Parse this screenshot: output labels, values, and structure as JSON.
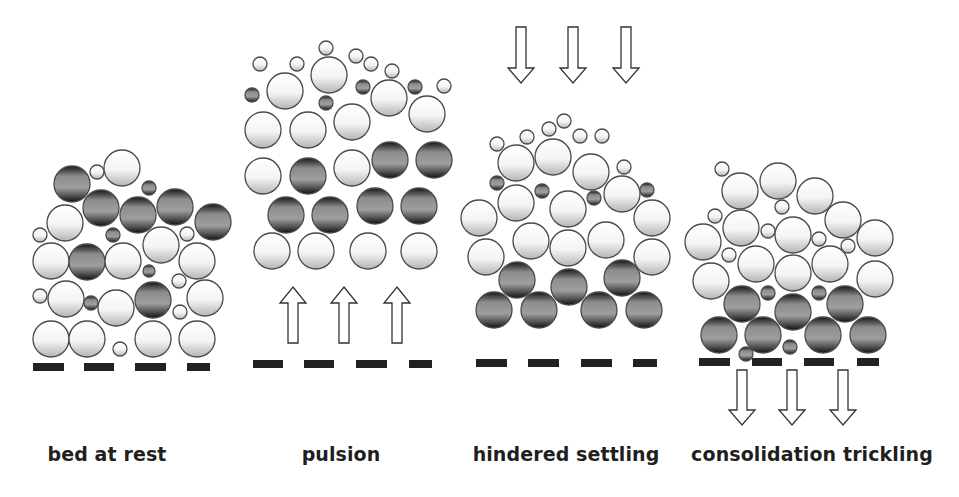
{
  "figure": {
    "colors": {
      "light_particle_top": "#ffffff",
      "light_particle_bottom": "#b8b8b8",
      "dense_particle_edge": "#1a1a1a",
      "dense_particle_mid": "#9a9a9a",
      "outline": "#4a4a4a",
      "base_bar": "#222222",
      "arrow_fill": "#ffffff",
      "arrow_stroke": "#333333"
    },
    "panels": [
      {
        "id": "bed-at-rest",
        "label": "bed at rest",
        "label_x": 107,
        "bars": [
          [
            33,
            64
          ],
          [
            84,
            114
          ],
          [
            135,
            166
          ],
          [
            187,
            210
          ]
        ],
        "bar_y": 363,
        "arrows": [],
        "particles": [
          {
            "x": 72,
            "y": 184,
            "r": 18,
            "t": "dense"
          },
          {
            "x": 97,
            "y": 172,
            "r": 7,
            "t": "light"
          },
          {
            "x": 122,
            "y": 168,
            "r": 18,
            "t": "light"
          },
          {
            "x": 149,
            "y": 188,
            "r": 7,
            "t": "dense"
          },
          {
            "x": 101,
            "y": 208,
            "r": 18,
            "t": "dense"
          },
          {
            "x": 138,
            "y": 215,
            "r": 18,
            "t": "dense"
          },
          {
            "x": 175,
            "y": 207,
            "r": 18,
            "t": "dense"
          },
          {
            "x": 213,
            "y": 222,
            "r": 18,
            "t": "dense"
          },
          {
            "x": 65,
            "y": 223,
            "r": 18,
            "t": "light"
          },
          {
            "x": 40,
            "y": 235,
            "r": 7,
            "t": "light"
          },
          {
            "x": 113,
            "y": 235,
            "r": 7,
            "t": "dense"
          },
          {
            "x": 161,
            "y": 245,
            "r": 18,
            "t": "light"
          },
          {
            "x": 187,
            "y": 234,
            "r": 7,
            "t": "light"
          },
          {
            "x": 51,
            "y": 261,
            "r": 18,
            "t": "light"
          },
          {
            "x": 87,
            "y": 262,
            "r": 18,
            "t": "dense"
          },
          {
            "x": 123,
            "y": 261,
            "r": 18,
            "t": "light"
          },
          {
            "x": 149,
            "y": 271,
            "r": 6,
            "t": "dense"
          },
          {
            "x": 197,
            "y": 261,
            "r": 18,
            "t": "light"
          },
          {
            "x": 179,
            "y": 281,
            "r": 7,
            "t": "light"
          },
          {
            "x": 40,
            "y": 296,
            "r": 7,
            "t": "light"
          },
          {
            "x": 66,
            "y": 299,
            "r": 18,
            "t": "light"
          },
          {
            "x": 91,
            "y": 303,
            "r": 7,
            "t": "dense"
          },
          {
            "x": 116,
            "y": 308,
            "r": 18,
            "t": "light"
          },
          {
            "x": 153,
            "y": 300,
            "r": 18,
            "t": "dense"
          },
          {
            "x": 180,
            "y": 312,
            "r": 7,
            "t": "light"
          },
          {
            "x": 205,
            "y": 298,
            "r": 18,
            "t": "light"
          },
          {
            "x": 51,
            "y": 339,
            "r": 18,
            "t": "light"
          },
          {
            "x": 87,
            "y": 339,
            "r": 18,
            "t": "light"
          },
          {
            "x": 120,
            "y": 349,
            "r": 7,
            "t": "light"
          },
          {
            "x": 153,
            "y": 339,
            "r": 18,
            "t": "light"
          },
          {
            "x": 197,
            "y": 339,
            "r": 18,
            "t": "light"
          }
        ]
      },
      {
        "id": "pulsion",
        "label": "pulsion",
        "label_x": 341,
        "bars": [
          [
            253,
            283
          ],
          [
            304,
            334
          ],
          [
            356,
            387
          ],
          [
            409,
            432
          ]
        ],
        "bar_y": 360,
        "arrows": [
          {
            "dir": "up",
            "x": 293,
            "tip": 287,
            "head_base": 303,
            "tail": 343
          },
          {
            "dir": "up",
            "x": 344,
            "tip": 287,
            "head_base": 303,
            "tail": 343
          },
          {
            "dir": "up",
            "x": 397,
            "tip": 287,
            "head_base": 303,
            "tail": 343
          }
        ],
        "particles": [
          {
            "x": 260,
            "y": 64,
            "r": 7,
            "t": "light"
          },
          {
            "x": 297,
            "y": 64,
            "r": 7,
            "t": "light"
          },
          {
            "x": 326,
            "y": 48,
            "r": 7,
            "t": "light"
          },
          {
            "x": 356,
            "y": 56,
            "r": 7,
            "t": "light"
          },
          {
            "x": 371,
            "y": 64,
            "r": 7,
            "t": "light"
          },
          {
            "x": 392,
            "y": 71,
            "r": 7,
            "t": "light"
          },
          {
            "x": 444,
            "y": 86,
            "r": 7,
            "t": "light"
          },
          {
            "x": 252,
            "y": 95,
            "r": 7,
            "t": "dense"
          },
          {
            "x": 285,
            "y": 91,
            "r": 18,
            "t": "light"
          },
          {
            "x": 329,
            "y": 75,
            "r": 18,
            "t": "light"
          },
          {
            "x": 326,
            "y": 103,
            "r": 7,
            "t": "dense"
          },
          {
            "x": 363,
            "y": 87,
            "r": 7,
            "t": "dense"
          },
          {
            "x": 389,
            "y": 98,
            "r": 18,
            "t": "light"
          },
          {
            "x": 415,
            "y": 87,
            "r": 7,
            "t": "dense"
          },
          {
            "x": 427,
            "y": 114,
            "r": 18,
            "t": "light"
          },
          {
            "x": 263,
            "y": 130,
            "r": 18,
            "t": "light"
          },
          {
            "x": 308,
            "y": 130,
            "r": 18,
            "t": "light"
          },
          {
            "x": 352,
            "y": 122,
            "r": 18,
            "t": "light"
          },
          {
            "x": 263,
            "y": 176,
            "r": 18,
            "t": "light"
          },
          {
            "x": 308,
            "y": 176,
            "r": 18,
            "t": "dense"
          },
          {
            "x": 352,
            "y": 168,
            "r": 18,
            "t": "light"
          },
          {
            "x": 390,
            "y": 160,
            "r": 18,
            "t": "dense"
          },
          {
            "x": 434,
            "y": 160,
            "r": 18,
            "t": "dense"
          },
          {
            "x": 286,
            "y": 215,
            "r": 18,
            "t": "dense"
          },
          {
            "x": 330,
            "y": 215,
            "r": 18,
            "t": "dense"
          },
          {
            "x": 375,
            "y": 206,
            "r": 18,
            "t": "dense"
          },
          {
            "x": 419,
            "y": 206,
            "r": 18,
            "t": "dense"
          },
          {
            "x": 272,
            "y": 251,
            "r": 18,
            "t": "light"
          },
          {
            "x": 316,
            "y": 251,
            "r": 18,
            "t": "light"
          },
          {
            "x": 368,
            "y": 251,
            "r": 18,
            "t": "light"
          },
          {
            "x": 419,
            "y": 251,
            "r": 18,
            "t": "light"
          }
        ]
      },
      {
        "id": "hindered-settling",
        "label": "hindered settling",
        "label_x": 566,
        "bars": [
          [
            476,
            507
          ],
          [
            528,
            559
          ],
          [
            581,
            612
          ],
          [
            633,
            657
          ]
        ],
        "bar_y": 359,
        "arrows": [
          {
            "dir": "down",
            "x": 521,
            "tip": 83,
            "head_base": 68,
            "tail": 27
          },
          {
            "dir": "down",
            "x": 573,
            "tip": 83,
            "head_base": 68,
            "tail": 27
          },
          {
            "dir": "down",
            "x": 626,
            "tip": 83,
            "head_base": 68,
            "tail": 27
          }
        ],
        "particles": [
          {
            "x": 497,
            "y": 144,
            "r": 7,
            "t": "light"
          },
          {
            "x": 527,
            "y": 137,
            "r": 7,
            "t": "light"
          },
          {
            "x": 549,
            "y": 129,
            "r": 7,
            "t": "light"
          },
          {
            "x": 564,
            "y": 121,
            "r": 7,
            "t": "light"
          },
          {
            "x": 580,
            "y": 136,
            "r": 7,
            "t": "light"
          },
          {
            "x": 602,
            "y": 136,
            "r": 7,
            "t": "light"
          },
          {
            "x": 624,
            "y": 167,
            "r": 7,
            "t": "light"
          },
          {
            "x": 516,
            "y": 163,
            "r": 18,
            "t": "light"
          },
          {
            "x": 553,
            "y": 157,
            "r": 18,
            "t": "light"
          },
          {
            "x": 591,
            "y": 172,
            "r": 18,
            "t": "light"
          },
          {
            "x": 497,
            "y": 183,
            "r": 7,
            "t": "dense"
          },
          {
            "x": 542,
            "y": 191,
            "r": 7,
            "t": "dense"
          },
          {
            "x": 594,
            "y": 198,
            "r": 7,
            "t": "dense"
          },
          {
            "x": 647,
            "y": 190,
            "r": 7,
            "t": "dense"
          },
          {
            "x": 516,
            "y": 203,
            "r": 18,
            "t": "light"
          },
          {
            "x": 568,
            "y": 209,
            "r": 18,
            "t": "light"
          },
          {
            "x": 622,
            "y": 194,
            "r": 18,
            "t": "light"
          },
          {
            "x": 479,
            "y": 218,
            "r": 18,
            "t": "light"
          },
          {
            "x": 652,
            "y": 218,
            "r": 18,
            "t": "light"
          },
          {
            "x": 531,
            "y": 241,
            "r": 18,
            "t": "light"
          },
          {
            "x": 568,
            "y": 248,
            "r": 18,
            "t": "light"
          },
          {
            "x": 606,
            "y": 240,
            "r": 18,
            "t": "light"
          },
          {
            "x": 486,
            "y": 257,
            "r": 18,
            "t": "light"
          },
          {
            "x": 652,
            "y": 257,
            "r": 18,
            "t": "light"
          },
          {
            "x": 517,
            "y": 280,
            "r": 18,
            "t": "dense"
          },
          {
            "x": 569,
            "y": 287,
            "r": 18,
            "t": "dense"
          },
          {
            "x": 622,
            "y": 278,
            "r": 18,
            "t": "dense"
          },
          {
            "x": 494,
            "y": 310,
            "r": 18,
            "t": "dense"
          },
          {
            "x": 539,
            "y": 310,
            "r": 18,
            "t": "dense"
          },
          {
            "x": 599,
            "y": 310,
            "r": 18,
            "t": "dense"
          },
          {
            "x": 644,
            "y": 310,
            "r": 18,
            "t": "dense"
          }
        ]
      },
      {
        "id": "consolidation-trickling",
        "label": "consolidation trickling",
        "label_x": 812,
        "bars": [
          [
            699,
            730
          ],
          [
            752,
            782
          ],
          [
            804,
            834
          ],
          [
            857,
            879
          ]
        ],
        "bar_y": 358,
        "arrows": [
          {
            "dir": "down",
            "x": 742,
            "tip": 425,
            "head_base": 410,
            "tail": 370
          },
          {
            "dir": "down",
            "x": 792,
            "tip": 425,
            "head_base": 410,
            "tail": 370
          },
          {
            "dir": "down",
            "x": 843,
            "tip": 425,
            "head_base": 410,
            "tail": 370
          }
        ],
        "particles": [
          {
            "x": 722,
            "y": 169,
            "r": 7,
            "t": "light"
          },
          {
            "x": 740,
            "y": 191,
            "r": 18,
            "t": "light"
          },
          {
            "x": 778,
            "y": 181,
            "r": 18,
            "t": "light"
          },
          {
            "x": 815,
            "y": 196,
            "r": 18,
            "t": "light"
          },
          {
            "x": 782,
            "y": 207,
            "r": 7,
            "t": "light"
          },
          {
            "x": 843,
            "y": 220,
            "r": 18,
            "t": "light"
          },
          {
            "x": 715,
            "y": 216,
            "r": 7,
            "t": "light"
          },
          {
            "x": 741,
            "y": 228,
            "r": 18,
            "t": "light"
          },
          {
            "x": 768,
            "y": 231,
            "r": 7,
            "t": "light"
          },
          {
            "x": 793,
            "y": 235,
            "r": 18,
            "t": "light"
          },
          {
            "x": 819,
            "y": 239,
            "r": 7,
            "t": "light"
          },
          {
            "x": 703,
            "y": 242,
            "r": 18,
            "t": "light"
          },
          {
            "x": 875,
            "y": 238,
            "r": 18,
            "t": "light"
          },
          {
            "x": 848,
            "y": 246,
            "r": 7,
            "t": "light"
          },
          {
            "x": 729,
            "y": 255,
            "r": 7,
            "t": "light"
          },
          {
            "x": 756,
            "y": 264,
            "r": 18,
            "t": "light"
          },
          {
            "x": 793,
            "y": 273,
            "r": 18,
            "t": "light"
          },
          {
            "x": 830,
            "y": 264,
            "r": 18,
            "t": "light"
          },
          {
            "x": 711,
            "y": 281,
            "r": 18,
            "t": "light"
          },
          {
            "x": 875,
            "y": 279,
            "r": 18,
            "t": "light"
          },
          {
            "x": 768,
            "y": 293,
            "r": 7,
            "t": "dense"
          },
          {
            "x": 819,
            "y": 293,
            "r": 7,
            "t": "dense"
          },
          {
            "x": 742,
            "y": 304,
            "r": 18,
            "t": "dense"
          },
          {
            "x": 793,
            "y": 312,
            "r": 18,
            "t": "dense"
          },
          {
            "x": 845,
            "y": 304,
            "r": 18,
            "t": "dense"
          },
          {
            "x": 719,
            "y": 335,
            "r": 18,
            "t": "dense"
          },
          {
            "x": 763,
            "y": 335,
            "r": 18,
            "t": "dense"
          },
          {
            "x": 823,
            "y": 335,
            "r": 18,
            "t": "dense"
          },
          {
            "x": 868,
            "y": 335,
            "r": 18,
            "t": "dense"
          },
          {
            "x": 790,
            "y": 347,
            "r": 7,
            "t": "dense"
          },
          {
            "x": 746,
            "y": 354,
            "r": 7,
            "t": "dense"
          }
        ]
      }
    ]
  }
}
